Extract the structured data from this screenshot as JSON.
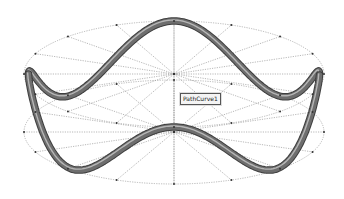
{
  "scene": {
    "type": "3d-cad-viewport",
    "object": "sinusoidal tube path wrapped on cylinder",
    "annotation_label": "PathCurve1",
    "colors": {
      "background": "#ffffff",
      "tube": "#6e6e6e",
      "tube_highlight": "#c8c8c8",
      "guide_lines": "#9a9a9a"
    },
    "top_ellipse": {
      "cx": 174,
      "cy": 74,
      "rx": 150,
      "ry": 53
    },
    "bottom_ellipse": {
      "cx": 174,
      "cy": 132,
      "rx": 150,
      "ry": 52
    },
    "spokes": 16,
    "waves": 4
  }
}
